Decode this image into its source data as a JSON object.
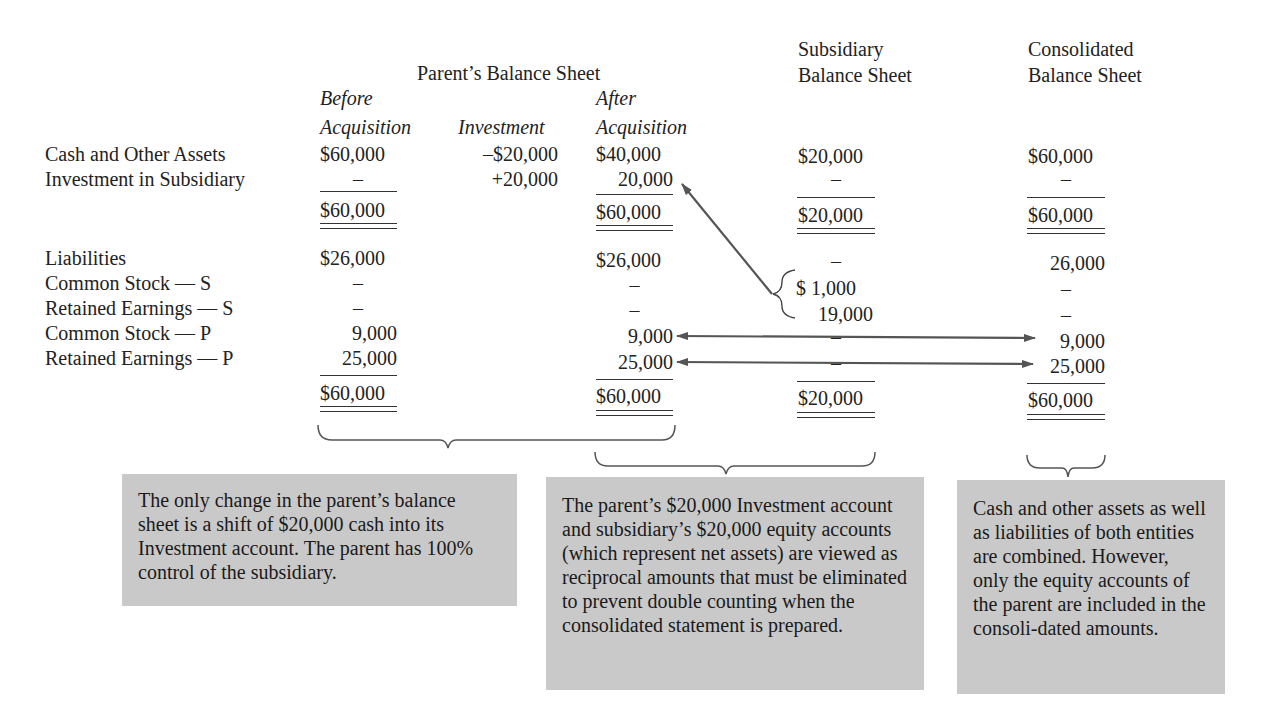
{
  "headers": {
    "parent_title": "Parent’s Balance Sheet",
    "col_before": [
      "Before",
      "Acquisition"
    ],
    "col_investment": "Investment",
    "col_after": [
      "After",
      "Acquisition"
    ],
    "subsidiary": [
      "Subsidiary",
      "Balance Sheet"
    ],
    "consolidated": [
      "Consolidated",
      "Balance Sheet"
    ]
  },
  "assets": {
    "rows": [
      {
        "label": "Cash and Other Assets",
        "before": "$60,000",
        "investment": "–$20,000",
        "after": "$40,000",
        "subsidiary": "$20,000",
        "consolidated": "$60,000"
      },
      {
        "label": "Investment in Subsidiary",
        "before": "–",
        "investment": "+20,000",
        "after": "20,000",
        "subsidiary": "–",
        "consolidated": "–"
      }
    ],
    "totals": {
      "before": "$60,000",
      "after": "$60,000",
      "subsidiary": "$20,000",
      "consolidated": "$60,000"
    }
  },
  "equity": {
    "rows": [
      {
        "label": "Liabilities",
        "before": "$26,000",
        "after": "$26,000",
        "subsidiary": "–",
        "consolidated": "26,000"
      },
      {
        "label": "Common Stock — S",
        "before": "–",
        "after": "–",
        "subsidiary": "$ 1,000",
        "consolidated": "–"
      },
      {
        "label": "Retained Earnings — S",
        "before": "–",
        "after": "–",
        "subsidiary": "19,000",
        "consolidated": "–"
      },
      {
        "label": "Common Stock — P",
        "before": "9,000",
        "after": "9,000",
        "subsidiary": "–",
        "consolidated": "9,000"
      },
      {
        "label": "Retained Earnings — P",
        "before": "25,000",
        "after": "25,000",
        "subsidiary": "–",
        "consolidated": "25,000"
      }
    ],
    "totals": {
      "before": "$60,000",
      "after": "$60,000",
      "subsidiary": "$20,000",
      "consolidated": "$60,000"
    }
  },
  "notes": {
    "parent": "The only change in the parent’s balance sheet is a shift of $20,000 cash into its Investment account. The parent has 100% control of the subsidiary.",
    "elimination": "The parent’s $20,000 Investment account and subsidiary’s $20,000 equity accounts (which represent net assets) are viewed as reciprocal amounts that must be eliminated to prevent double counting when the consolidated statement is prepared.",
    "consolidated": "Cash and other assets as well as liabilities of both entities are combined. However, only the equity accounts of the parent are included in the consoli-dated amounts."
  },
  "colors": {
    "box_gray": "#c9c9c9",
    "ink": "#222222",
    "arrow": "#555555"
  }
}
